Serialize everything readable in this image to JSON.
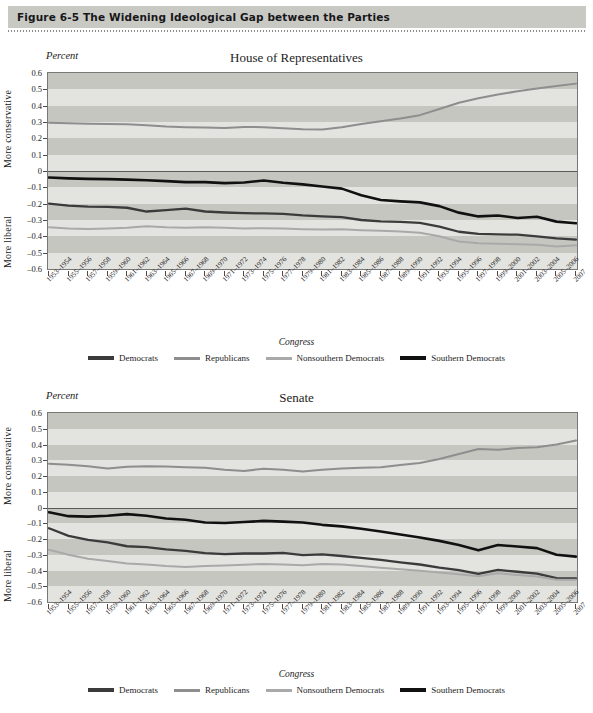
{
  "figure": {
    "banner_label": "Figure 6-5  The Widening Ideological Gap between the Parties"
  },
  "colors": {
    "democrats": "#3b3b3b",
    "republicans": "#8e8e8e",
    "nonsouthern_democrats": "#a9a9a9",
    "southern_democrats": "#111111",
    "band_dark": "#c6c6c1",
    "band_light": "#e3e3df",
    "banner": "#c9c9c4",
    "axis": "#777777"
  },
  "legend": {
    "items": [
      {
        "label": "Democrats",
        "color": "#3b3b3b",
        "width": 3.4
      },
      {
        "label": "Republicans",
        "color": "#8e8e8e",
        "width": 3.0
      },
      {
        "label": "Nonsouthern Democrats",
        "color": "#a9a9a9",
        "width": 3.0
      },
      {
        "label": "Southern Democrats",
        "color": "#111111",
        "width": 3.6
      }
    ]
  },
  "axis_common": {
    "y_unit_label": "Percent",
    "y_dir_top": "More conservative",
    "y_dir_bottom": "More liberal",
    "x_title": "Congress",
    "y_ticks": [
      "0.6",
      "0.5",
      "0.4",
      "0.3",
      "0.2",
      "0.1",
      "0",
      "-0.1",
      "-0.2",
      "-0.3",
      "-0.4",
      "-0.5",
      "-0.6"
    ],
    "x_tick_labels": [
      "1953-1954",
      "1955-1956",
      "1957-1958",
      "1959-1960",
      "1961-1962",
      "1963-1964",
      "1965-1966",
      "1967-1968",
      "1969-1970",
      "1971-1972",
      "1973-1974",
      "1975-1976",
      "1977-1978",
      "1979-1980",
      "1981-1982",
      "1983-1984",
      "1985-1986",
      "1987-1988",
      "1989-1990",
      "1991-1992",
      "1993-1994",
      "1995-1996",
      "1997-1998",
      "1999-2000",
      "2001-2002",
      "2003-2004",
      "2005-2006",
      "2007"
    ]
  },
  "chart_data": [
    {
      "type": "line",
      "title": "House of Representatives",
      "xlabel": "Congress",
      "ylabel": "Percent",
      "ylim": [
        -0.6,
        0.6
      ],
      "grid": "horizontal-bands",
      "legend_position": "bottom",
      "x": [
        "1953-1954",
        "1955-1956",
        "1957-1958",
        "1959-1960",
        "1961-1962",
        "1963-1964",
        "1965-1966",
        "1967-1968",
        "1969-1970",
        "1971-1972",
        "1973-1974",
        "1975-1976",
        "1977-1978",
        "1979-1980",
        "1981-1982",
        "1983-1984",
        "1985-1986",
        "1987-1988",
        "1989-1990",
        "1991-1992",
        "1993-1994",
        "1995-1996",
        "1997-1998",
        "1999-2000",
        "2001-2002",
        "2003-2004",
        "2005-2006",
        "2007"
      ],
      "series": [
        {
          "name": "Republicans",
          "color": "#8e8e8e",
          "values": [
            0.295,
            0.293,
            0.29,
            0.288,
            0.286,
            0.28,
            0.272,
            0.268,
            0.266,
            0.264,
            0.27,
            0.268,
            0.262,
            0.256,
            0.254,
            0.268,
            0.288,
            0.305,
            0.322,
            0.342,
            0.38,
            0.418,
            0.445,
            0.468,
            0.488,
            0.505,
            0.52,
            0.535
          ]
        },
        {
          "name": "Southern Democrats",
          "color": "#111111",
          "values": [
            -0.04,
            -0.045,
            -0.048,
            -0.05,
            -0.053,
            -0.057,
            -0.062,
            -0.068,
            -0.068,
            -0.074,
            -0.07,
            -0.058,
            -0.072,
            -0.082,
            -0.095,
            -0.108,
            -0.148,
            -0.178,
            -0.186,
            -0.192,
            -0.215,
            -0.255,
            -0.278,
            -0.272,
            -0.288,
            -0.28,
            -0.31,
            -0.32
          ]
        },
        {
          "name": "Democrats",
          "color": "#3b3b3b",
          "values": [
            -0.2,
            -0.212,
            -0.218,
            -0.22,
            -0.225,
            -0.248,
            -0.24,
            -0.23,
            -0.248,
            -0.254,
            -0.258,
            -0.26,
            -0.262,
            -0.272,
            -0.278,
            -0.282,
            -0.3,
            -0.308,
            -0.312,
            -0.318,
            -0.34,
            -0.372,
            -0.385,
            -0.388,
            -0.39,
            -0.4,
            -0.412,
            -0.42
          ]
        },
        {
          "name": "Nonsouthern Democrats",
          "color": "#a9a9a9",
          "values": [
            -0.345,
            -0.352,
            -0.355,
            -0.352,
            -0.348,
            -0.338,
            -0.345,
            -0.348,
            -0.345,
            -0.348,
            -0.352,
            -0.35,
            -0.352,
            -0.356,
            -0.358,
            -0.356,
            -0.362,
            -0.366,
            -0.37,
            -0.378,
            -0.4,
            -0.432,
            -0.442,
            -0.446,
            -0.448,
            -0.452,
            -0.462,
            -0.455
          ]
        }
      ]
    },
    {
      "type": "line",
      "title": "Senate",
      "xlabel": "Congress",
      "ylabel": "Percent",
      "ylim": [
        -0.6,
        0.6
      ],
      "grid": "horizontal-bands",
      "legend_position": "bottom",
      "x": [
        "1953-1954",
        "1955-1956",
        "1957-1958",
        "1959-1960",
        "1961-1962",
        "1963-1964",
        "1965-1966",
        "1967-1968",
        "1969-1970",
        "1971-1972",
        "1973-1974",
        "1975-1976",
        "1977-1978",
        "1979-1980",
        "1981-1982",
        "1983-1984",
        "1985-1986",
        "1987-1988",
        "1989-1990",
        "1991-1992",
        "1993-1994",
        "1995-1996",
        "1997-1998",
        "1999-2000",
        "2001-2002",
        "2003-2004",
        "2005-2006",
        "2007"
      ],
      "series": [
        {
          "name": "Republicans",
          "color": "#8e8e8e",
          "values": [
            0.278,
            0.272,
            0.262,
            0.248,
            0.258,
            0.262,
            0.26,
            0.256,
            0.252,
            0.24,
            0.232,
            0.246,
            0.24,
            0.228,
            0.24,
            0.248,
            0.252,
            0.256,
            0.27,
            0.282,
            0.308,
            0.34,
            0.372,
            0.366,
            0.378,
            0.382,
            0.4,
            0.425
          ]
        },
        {
          "name": "Southern Democrats",
          "color": "#111111",
          "values": [
            -0.03,
            -0.055,
            -0.058,
            -0.052,
            -0.042,
            -0.052,
            -0.07,
            -0.078,
            -0.095,
            -0.098,
            -0.092,
            -0.085,
            -0.09,
            -0.095,
            -0.11,
            -0.12,
            -0.135,
            -0.152,
            -0.172,
            -0.19,
            -0.212,
            -0.238,
            -0.272,
            -0.238,
            -0.248,
            -0.258,
            -0.3,
            -0.312
          ]
        },
        {
          "name": "Democrats",
          "color": "#3b3b3b",
          "values": [
            -0.132,
            -0.18,
            -0.206,
            -0.222,
            -0.246,
            -0.252,
            -0.266,
            -0.276,
            -0.29,
            -0.296,
            -0.292,
            -0.292,
            -0.288,
            -0.302,
            -0.298,
            -0.308,
            -0.32,
            -0.332,
            -0.348,
            -0.362,
            -0.382,
            -0.398,
            -0.422,
            -0.396,
            -0.408,
            -0.42,
            -0.448,
            -0.45
          ]
        },
        {
          "name": "Nonsouthern Democrats",
          "color": "#a9a9a9",
          "values": [
            -0.268,
            -0.3,
            -0.325,
            -0.34,
            -0.356,
            -0.362,
            -0.372,
            -0.378,
            -0.372,
            -0.368,
            -0.364,
            -0.358,
            -0.362,
            -0.366,
            -0.358,
            -0.362,
            -0.372,
            -0.382,
            -0.392,
            -0.402,
            -0.412,
            -0.424,
            -0.436,
            -0.418,
            -0.428,
            -0.438,
            -0.458,
            -0.458
          ]
        }
      ]
    }
  ]
}
